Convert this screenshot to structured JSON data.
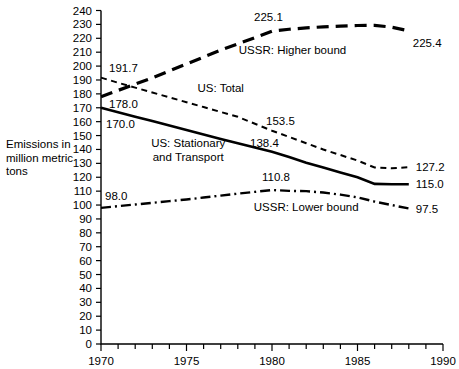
{
  "chart_data": {
    "type": "line",
    "title": "",
    "subtitle": "",
    "xlabel": "",
    "ylabel": "Emissions in million metric tons",
    "xlim": [
      1970,
      1990
    ],
    "ylim": [
      0,
      240
    ],
    "xticks": [
      1970,
      1975,
      1980,
      1985,
      1990
    ],
    "xtick_labels": [
      "1970",
      "1975",
      "1980",
      "1985",
      "1990"
    ],
    "xminor_step": 1,
    "yticks": [
      0,
      10,
      20,
      30,
      40,
      50,
      60,
      70,
      80,
      90,
      100,
      110,
      120,
      130,
      140,
      150,
      160,
      170,
      180,
      190,
      200,
      210,
      220,
      230,
      240
    ],
    "ytick_labels": [
      "0",
      "10",
      "20",
      "30",
      "40",
      "50",
      "60",
      "70",
      "80",
      "90",
      "100",
      "110",
      "120",
      "130",
      "140",
      "150",
      "160",
      "170",
      "180",
      "190",
      "200",
      "210",
      "220",
      "230",
      "240"
    ],
    "grid": false,
    "legend_position": "inline-annotations",
    "series": [
      {
        "name": "USSR: Higher bound",
        "style": "long-dashed",
        "dash": "12,7",
        "width": 3.2,
        "x": [
          1970,
          1971,
          1972,
          1973,
          1974,
          1975,
          1976,
          1977,
          1978,
          1979,
          1980,
          1981,
          1982,
          1983,
          1984,
          1985,
          1986,
          1987,
          1988
        ],
        "values": [
          178.0,
          182.5,
          187.0,
          191.5,
          196.5,
          201.5,
          206.5,
          211.5,
          216.0,
          220.5,
          225.1,
          226.5,
          227.5,
          228.2,
          228.8,
          229.2,
          229.3,
          228.0,
          225.4
        ]
      },
      {
        "name": "US: Total",
        "style": "short-dashed",
        "dash": "6,4.5",
        "width": 2.0,
        "x": [
          1970,
          1971,
          1972,
          1973,
          1974,
          1975,
          1976,
          1977,
          1978,
          1979,
          1980,
          1981,
          1982,
          1983,
          1984,
          1985,
          1986,
          1987,
          1988
        ],
        "values": [
          191.7,
          188.0,
          184.5,
          181.0,
          177.5,
          174.0,
          170.5,
          167.0,
          163.5,
          158.5,
          153.5,
          149.0,
          144.5,
          140.0,
          136.0,
          132.0,
          127.0,
          126.5,
          127.2
        ]
      },
      {
        "name": "US: Stationary and Transport",
        "style": "solid",
        "dash": "none",
        "width": 2.6,
        "x": [
          1970,
          1971,
          1972,
          1973,
          1974,
          1975,
          1976,
          1977,
          1978,
          1979,
          1980,
          1981,
          1982,
          1983,
          1984,
          1985,
          1986,
          1987,
          1988
        ],
        "values": [
          170.0,
          166.8,
          163.6,
          160.4,
          157.2,
          154.0,
          150.8,
          147.6,
          144.4,
          141.4,
          138.4,
          134.5,
          130.5,
          127.0,
          123.5,
          120.0,
          115.2,
          115.0,
          115.0
        ]
      },
      {
        "name": "USSR: Lower bound",
        "style": "dash-dot",
        "dash": "10,4,2,4",
        "width": 2.4,
        "x": [
          1970,
          1971,
          1972,
          1973,
          1974,
          1975,
          1976,
          1977,
          1978,
          1979,
          1980,
          1981,
          1982,
          1983,
          1984,
          1985,
          1986,
          1987,
          1988
        ],
        "values": [
          98.0,
          99.2,
          100.4,
          101.6,
          102.8,
          104.0,
          105.4,
          106.8,
          108.2,
          109.5,
          110.8,
          110.2,
          110.0,
          109.0,
          107.5,
          105.5,
          102.5,
          100.0,
          97.5
        ]
      }
    ],
    "point_labels": [
      {
        "text": "191.7",
        "x": 1970,
        "y": 191.7,
        "dx": 8,
        "dy": -6,
        "anchor": "start"
      },
      {
        "text": "178.0",
        "x": 1970,
        "y": 178.0,
        "dx": 8,
        "dy": 11,
        "anchor": "start"
      },
      {
        "text": "170.0",
        "x": 1970,
        "y": 170.0,
        "dx": 5,
        "dy": 20,
        "anchor": "start"
      },
      {
        "text": "98.0",
        "x": 1970,
        "y": 98.0,
        "dx": 4,
        "dy": -8,
        "anchor": "start"
      },
      {
        "text": "225.1",
        "x": 1980,
        "y": 225.1,
        "dx": -18,
        "dy": -10,
        "anchor": "start"
      },
      {
        "text": "153.5",
        "x": 1980,
        "y": 153.5,
        "dx": -6,
        "dy": -6,
        "anchor": "start"
      },
      {
        "text": "138.4",
        "x": 1980,
        "y": 138.4,
        "dx": -22,
        "dy": -5,
        "anchor": "start"
      },
      {
        "text": "110.8",
        "x": 1980,
        "y": 110.8,
        "dx": -10,
        "dy": -9,
        "anchor": "start"
      },
      {
        "text": "225.4",
        "x": 1988,
        "y": 225.4,
        "dx": 4,
        "dy": 16,
        "anchor": "start"
      },
      {
        "text": "127.2",
        "x": 1988,
        "y": 127.2,
        "dx": 7,
        "dy": 4,
        "anchor": "start"
      },
      {
        "text": "115.0",
        "x": 1988,
        "y": 115.0,
        "dx": 7,
        "dy": 4,
        "anchor": "start"
      },
      {
        "text": "97.5",
        "x": 1988,
        "y": 97.5,
        "dx": 7,
        "dy": 4,
        "anchor": "start"
      }
    ],
    "series_annotations": [
      {
        "text": "USSR: Higher bound",
        "x": 1981.2,
        "y": 209.0,
        "anchor": "middle"
      },
      {
        "text": "US: Total",
        "x": 1977.0,
        "y": 181.0,
        "anchor": "middle"
      },
      {
        "text": "USSR: Lower bound",
        "x": 1982.0,
        "y": 95.5,
        "anchor": "middle"
      }
    ],
    "multiline_annotations": [
      {
        "lines": [
          "US: Stationary",
          "and Transport"
        ],
        "x": 1975.1,
        "y": 142.0,
        "anchor": "middle"
      }
    ]
  },
  "axis": {
    "y_title_lines": [
      "Emissions in",
      "million metric",
      "tons"
    ]
  }
}
